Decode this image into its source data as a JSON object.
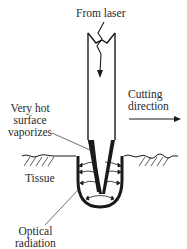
{
  "diagram": {
    "labels": {
      "from_laser": "From laser",
      "very_hot_line1": "Very hot",
      "very_hot_line2": "surface",
      "very_hot_line3": "vaporizes",
      "cutting_line1": "Cutting",
      "cutting_line2": "direction",
      "tissue": "Tissue",
      "optical_line1": "Optical",
      "optical_line2": "radiation"
    },
    "components": [
      "laser fiber",
      "tapered tip",
      "tissue surface",
      "crater",
      "radiation arrows",
      "cutting direction arrow"
    ],
    "colors": {
      "ink": "#1a1a1a",
      "background": "#ffffff"
    }
  }
}
